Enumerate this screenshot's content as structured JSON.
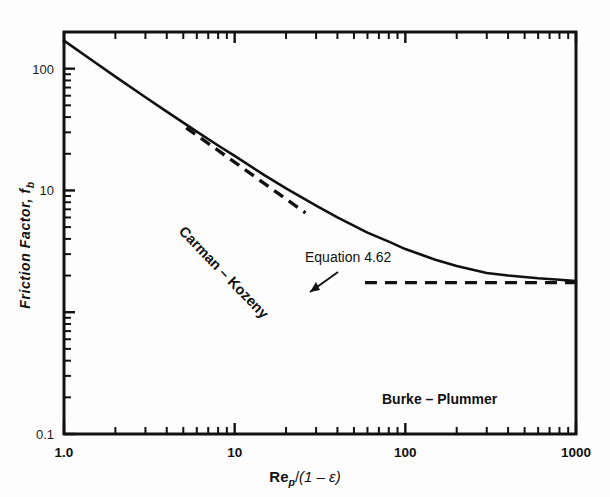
{
  "chart_data": {
    "type": "line",
    "title": "",
    "xlabel": "Re_p/(1 - ε)",
    "ylabel": "Friction Factor, f_b",
    "xscale": "log",
    "yscale": "log",
    "xlim": [
      1.0,
      1000
    ],
    "ylim": [
      0.1,
      200
    ],
    "grid": false,
    "legend": "none",
    "xticks": [
      "1.0",
      "10",
      "100",
      "1000"
    ],
    "xtick_values": [
      1.0,
      10,
      100,
      1000
    ],
    "yticks": [
      "0.1",
      "10",
      "100"
    ],
    "ytick_values": [
      0.1,
      10,
      100
    ],
    "series": [
      {
        "name": "Equation 4.62",
        "style": "solid",
        "x": [
          1.0,
          1.5,
          2.0,
          3.0,
          4.0,
          6.0,
          8.0,
          10,
          15,
          20,
          30,
          40,
          60,
          80,
          100,
          150,
          200,
          300,
          400,
          600,
          800,
          1000
        ],
        "y": [
          170,
          114,
          86,
          58.3,
          44.4,
          30.4,
          23.4,
          19.2,
          13.3,
          10.4,
          7.5,
          6.0,
          4.5,
          3.8,
          3.3,
          2.7,
          2.4,
          2.1,
          2.0,
          1.9,
          1.85,
          1.8
        ]
      },
      {
        "name": "Carman - Kozeny",
        "style": "dashed",
        "x": [
          5.2,
          8,
          12,
          18,
          26
        ],
        "y": [
          32.7,
          21.3,
          14.2,
          9.44,
          6.54
        ]
      },
      {
        "name": "Burke - Plummer",
        "style": "dashed",
        "x": [
          58,
          100,
          200,
          400,
          700,
          1000
        ],
        "y": [
          1.75,
          1.75,
          1.75,
          1.75,
          1.75,
          1.75
        ]
      }
    ],
    "annotations": [
      {
        "name": "equation-label",
        "text": "Equation  4.62",
        "x_px": 305,
        "y_px": 262,
        "rotation": 0,
        "has_arrow": true
      },
      {
        "name": "carman-kozeny-label",
        "text": "Carman – Kozeny",
        "x_px": 175,
        "y_px": 225,
        "rotation": 46,
        "has_arrow": false
      },
      {
        "name": "burke-plummer-label",
        "text": "Burke – Plummer",
        "x_px": 382,
        "y_px": 403,
        "rotation": 0,
        "has_arrow": false
      }
    ]
  },
  "axes": {
    "y_title_parts": {
      "main": "Friction Factor, f",
      "sub": "b"
    },
    "x_title_parts": {
      "re": "Re",
      "re_sub": "p",
      "slash": "/",
      "paren": "(1 – ε)"
    },
    "y_tick_labels": [
      "100",
      "10",
      "0.1"
    ],
    "x_tick_labels": [
      "1.0",
      "10",
      "100",
      "1000"
    ]
  },
  "annotations": {
    "equation": "Equation  4.62",
    "carman_kozeny": "Carman – Kozeny",
    "burke_plummer": "Burke – Plummer"
  },
  "colors": {
    "curve": "#111111",
    "axis": "#111111",
    "background": "#fdfdfd",
    "text": "#111111"
  }
}
